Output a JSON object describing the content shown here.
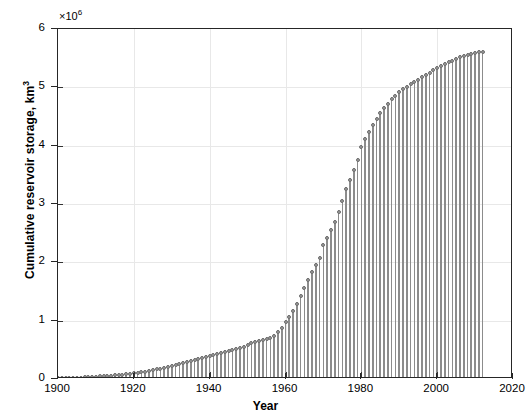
{
  "chart_data": {
    "type": "bar",
    "title": "",
    "subtitle": "",
    "xlabel": "Year",
    "ylabel": "Cumulative reservoir storage, km",
    "ylabel_sup": "3",
    "y_multiplier_prefix": "×10",
    "y_multiplier_exponent": "6",
    "y_multiplier_value": 1000000,
    "xlim": [
      1900,
      2020
    ],
    "ylim": [
      0,
      6
    ],
    "xticks": [
      1900,
      1920,
      1940,
      1960,
      1980,
      2000,
      2020
    ],
    "yticks": [
      0,
      1,
      2,
      3,
      4,
      5,
      6
    ],
    "xticklabels": [
      "1900",
      "1920",
      "1940",
      "1960",
      "1980",
      "2000",
      "2020"
    ],
    "yticklabels": [
      "0",
      "1",
      "2",
      "3",
      "4",
      "5",
      "6"
    ],
    "grid": true,
    "legend": null,
    "marker": "circle",
    "series_color": "#8c8c8c",
    "marker_color": "#9a9a9a",
    "note": "Values are in units of 1e6 km^3; stem plot of annual cumulative totals 1900-2012",
    "x": [
      1900,
      1901,
      1902,
      1903,
      1904,
      1905,
      1906,
      1907,
      1908,
      1909,
      1910,
      1911,
      1912,
      1913,
      1914,
      1915,
      1916,
      1917,
      1918,
      1919,
      1920,
      1921,
      1922,
      1923,
      1924,
      1925,
      1926,
      1927,
      1928,
      1929,
      1930,
      1931,
      1932,
      1933,
      1934,
      1935,
      1936,
      1937,
      1938,
      1939,
      1940,
      1941,
      1942,
      1943,
      1944,
      1945,
      1946,
      1947,
      1948,
      1949,
      1950,
      1951,
      1952,
      1953,
      1954,
      1955,
      1956,
      1957,
      1958,
      1959,
      1960,
      1961,
      1962,
      1963,
      1964,
      1965,
      1966,
      1967,
      1968,
      1969,
      1970,
      1971,
      1972,
      1973,
      1974,
      1975,
      1976,
      1977,
      1978,
      1979,
      1980,
      1981,
      1982,
      1983,
      1984,
      1985,
      1986,
      1987,
      1988,
      1989,
      1990,
      1991,
      1992,
      1993,
      1994,
      1995,
      1996,
      1997,
      1998,
      1999,
      2000,
      2001,
      2002,
      2003,
      2004,
      2005,
      2006,
      2007,
      2008,
      2009,
      2010,
      2011,
      2012
    ],
    "values": [
      0.01,
      0.012,
      0.014,
      0.016,
      0.018,
      0.021,
      0.024,
      0.027,
      0.03,
      0.034,
      0.038,
      0.043,
      0.048,
      0.053,
      0.058,
      0.064,
      0.07,
      0.077,
      0.084,
      0.091,
      0.099,
      0.108,
      0.117,
      0.127,
      0.138,
      0.15,
      0.163,
      0.177,
      0.192,
      0.208,
      0.224,
      0.24,
      0.256,
      0.272,
      0.288,
      0.304,
      0.322,
      0.342,
      0.362,
      0.382,
      0.4,
      0.418,
      0.434,
      0.448,
      0.462,
      0.476,
      0.492,
      0.51,
      0.53,
      0.556,
      0.59,
      0.61,
      0.628,
      0.646,
      0.664,
      0.682,
      0.706,
      0.742,
      0.8,
      0.88,
      0.98,
      1.07,
      1.17,
      1.29,
      1.42,
      1.56,
      1.7,
      1.84,
      1.96,
      2.08,
      2.3,
      2.42,
      2.56,
      2.7,
      2.86,
      3.06,
      3.26,
      3.42,
      3.58,
      3.76,
      3.98,
      4.12,
      4.24,
      4.36,
      4.46,
      4.56,
      4.64,
      4.72,
      4.8,
      4.86,
      4.92,
      4.97,
      5.01,
      5.05,
      5.09,
      5.13,
      5.17,
      5.21,
      5.25,
      5.29,
      5.33,
      5.37,
      5.4,
      5.43,
      5.46,
      5.49,
      5.52,
      5.54,
      5.56,
      5.58,
      5.59,
      5.6,
      5.6
    ]
  }
}
